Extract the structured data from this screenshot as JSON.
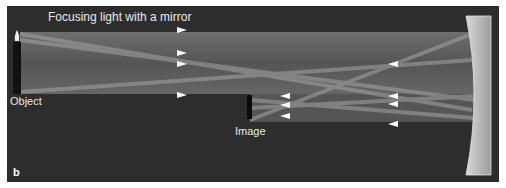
{
  "title": "Focusing light with a mirror",
  "labels": {
    "object": "Object",
    "image": "Image",
    "panel": "b"
  },
  "colors": {
    "background": "#2d2d2d",
    "beam": "#6e6e6e",
    "ray": "#9a9a9a",
    "arrow": "#ffffff",
    "mirror": "#b4b4b4",
    "candle": "#111111",
    "flame": "#f2efe2"
  },
  "icons": [
    "candle-icon",
    "mirror-icon",
    "arrow-right-icon",
    "arrow-left-icon"
  ]
}
